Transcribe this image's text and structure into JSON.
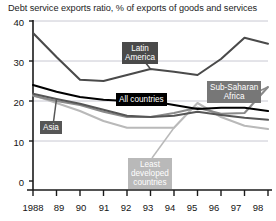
{
  "chart_data": {
    "type": "line",
    "title": "Debt service exports ratio, % of exports of goods and services",
    "xlabel": "",
    "ylabel": "",
    "ylim": [
      0,
      40
    ],
    "yticks": [
      0,
      10,
      20,
      30,
      40
    ],
    "grid": true,
    "legend_position": "inline-callouts",
    "x": [
      "1988",
      "89",
      "90",
      "91",
      "92",
      "93",
      "94",
      "95",
      "96",
      "97",
      "98"
    ],
    "series": [
      {
        "name": "Latin America",
        "color": "#4a4a4a",
        "values": [
          37.0,
          31.0,
          25.3,
          25.0,
          26.5,
          28.0,
          27.3,
          26.5,
          30.5,
          35.8,
          34.3
        ]
      },
      {
        "name": "All countries",
        "color": "#000000",
        "values": [
          24.0,
          22.3,
          21.0,
          20.3,
          20.0,
          20.0,
          19.0,
          18.0,
          18.3,
          18.3,
          17.5
        ]
      },
      {
        "name": "Asia",
        "color": "#565656",
        "values": [
          21.8,
          20.5,
          19.3,
          17.8,
          16.3,
          16.0,
          16.3,
          17.3,
          16.5,
          15.8,
          15.3
        ]
      },
      {
        "name": "Sub-Saharan Africa",
        "color": "#8a8a8a",
        "values": [
          21.3,
          20.0,
          19.0,
          17.3,
          16.0,
          16.0,
          17.0,
          18.3,
          16.8,
          17.0,
          23.5
        ]
      },
      {
        "name": "Least developed countries",
        "color": "#b9b9b9",
        "values": [
          21.5,
          19.5,
          17.5,
          15.0,
          13.3,
          13.3,
          13.3,
          19.5,
          16.0,
          13.8,
          13.0
        ]
      }
    ]
  },
  "axis": {
    "y_ticks": [
      "40",
      "30",
      "20",
      "10",
      "0"
    ],
    "x_ticks": [
      "1988",
      "89",
      "90",
      "91",
      "92",
      "93",
      "94",
      "95",
      "96",
      "97",
      "98"
    ]
  },
  "callouts": {
    "latin_america": "Latin\nAmerica",
    "latin_america_line1": "Latin",
    "latin_america_line2": "America",
    "all_countries": "All countries",
    "sub_saharan_line1": "Sub-Saharan",
    "sub_saharan_line2": "Africa",
    "asia": "Asia",
    "ldc_line1": "Least",
    "ldc_line2": "developed",
    "ldc_line3": "countries"
  },
  "colors": {
    "latin_america": "#4a4a4a",
    "all_countries": "#000000",
    "asia": "#565656",
    "sub_saharan": "#8a8a8a",
    "least_developed": "#b9b9b9",
    "axis": "#1a1a1a",
    "grid": "#c8c8d2",
    "background": "#ffffff"
  }
}
